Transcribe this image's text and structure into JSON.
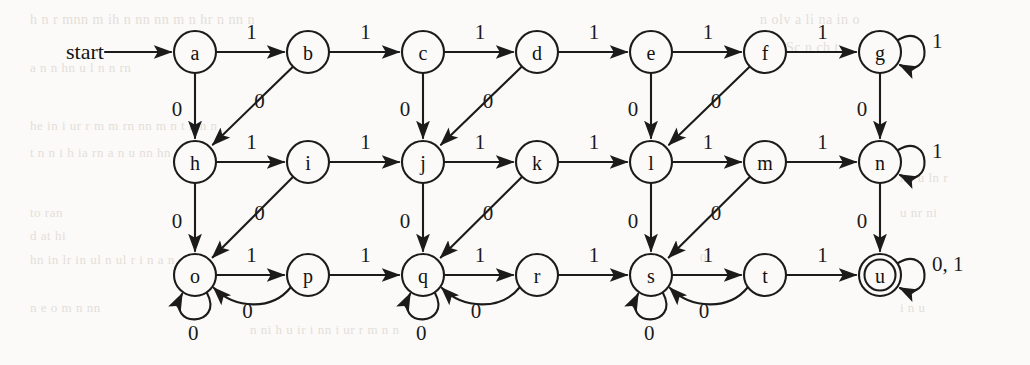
{
  "figure": {
    "kind": "finite-state-machine-diagram",
    "alphabet": [
      "0",
      "1"
    ],
    "start_label": "start",
    "start_state": "a",
    "accepting_states": [
      "u"
    ],
    "ink_color": "#1b1b1b",
    "page_color": "#fbfaf8"
  },
  "layout": {
    "width": 1030,
    "height": 365,
    "node_radius": 21,
    "columns_x": [
      195,
      308,
      423,
      537,
      651,
      765,
      880
    ],
    "rows_y": [
      52,
      162,
      275
    ]
  },
  "nodes": [
    {
      "id": "a",
      "label": "a",
      "col": 0,
      "row": 0,
      "accepting": false
    },
    {
      "id": "b",
      "label": "b",
      "col": 1,
      "row": 0,
      "accepting": false
    },
    {
      "id": "c",
      "label": "c",
      "col": 2,
      "row": 0,
      "accepting": false
    },
    {
      "id": "d",
      "label": "d",
      "col": 3,
      "row": 0,
      "accepting": false
    },
    {
      "id": "e",
      "label": "e",
      "col": 4,
      "row": 0,
      "accepting": false
    },
    {
      "id": "f",
      "label": "f",
      "col": 5,
      "row": 0,
      "accepting": false
    },
    {
      "id": "g",
      "label": "g",
      "col": 6,
      "row": 0,
      "accepting": false
    },
    {
      "id": "h",
      "label": "h",
      "col": 0,
      "row": 1,
      "accepting": false
    },
    {
      "id": "i",
      "label": "i",
      "col": 1,
      "row": 1,
      "accepting": false
    },
    {
      "id": "j",
      "label": "j",
      "col": 2,
      "row": 1,
      "accepting": false
    },
    {
      "id": "k",
      "label": "k",
      "col": 3,
      "row": 1,
      "accepting": false
    },
    {
      "id": "l",
      "label": "l",
      "col": 4,
      "row": 1,
      "accepting": false
    },
    {
      "id": "m",
      "label": "m",
      "col": 5,
      "row": 1,
      "accepting": false
    },
    {
      "id": "n",
      "label": "n",
      "col": 6,
      "row": 1,
      "accepting": false
    },
    {
      "id": "o",
      "label": "o",
      "col": 0,
      "row": 2,
      "accepting": false
    },
    {
      "id": "p",
      "label": "p",
      "col": 1,
      "row": 2,
      "accepting": false
    },
    {
      "id": "q",
      "label": "q",
      "col": 2,
      "row": 2,
      "accepting": false
    },
    {
      "id": "r",
      "label": "r",
      "col": 3,
      "row": 2,
      "accepting": false
    },
    {
      "id": "s",
      "label": "s",
      "col": 4,
      "row": 2,
      "accepting": false
    },
    {
      "id": "t",
      "label": "t",
      "col": 5,
      "row": 2,
      "accepting": false
    },
    {
      "id": "u",
      "label": "u",
      "col": 6,
      "row": 2,
      "accepting": true
    }
  ],
  "edges": [
    {
      "from": "a",
      "to": "b",
      "label": "1",
      "kind": "horizontal"
    },
    {
      "from": "b",
      "to": "c",
      "label": "1",
      "kind": "horizontal"
    },
    {
      "from": "c",
      "to": "d",
      "label": "1",
      "kind": "horizontal"
    },
    {
      "from": "d",
      "to": "e",
      "label": "1",
      "kind": "horizontal"
    },
    {
      "from": "e",
      "to": "f",
      "label": "1",
      "kind": "horizontal"
    },
    {
      "from": "f",
      "to": "g",
      "label": "1",
      "kind": "horizontal"
    },
    {
      "from": "h",
      "to": "i",
      "label": "1",
      "kind": "horizontal"
    },
    {
      "from": "i",
      "to": "j",
      "label": "1",
      "kind": "horizontal"
    },
    {
      "from": "j",
      "to": "k",
      "label": "1",
      "kind": "horizontal"
    },
    {
      "from": "k",
      "to": "l",
      "label": "1",
      "kind": "horizontal"
    },
    {
      "from": "l",
      "to": "m",
      "label": "1",
      "kind": "horizontal"
    },
    {
      "from": "m",
      "to": "n",
      "label": "1",
      "kind": "horizontal"
    },
    {
      "from": "o",
      "to": "p",
      "label": "1",
      "kind": "horizontal"
    },
    {
      "from": "p",
      "to": "q",
      "label": "1",
      "kind": "horizontal"
    },
    {
      "from": "q",
      "to": "r",
      "label": "1",
      "kind": "horizontal"
    },
    {
      "from": "r",
      "to": "s",
      "label": "1",
      "kind": "horizontal"
    },
    {
      "from": "s",
      "to": "t",
      "label": "1",
      "kind": "horizontal"
    },
    {
      "from": "t",
      "to": "u",
      "label": "1",
      "kind": "horizontal"
    },
    {
      "from": "a",
      "to": "h",
      "label": "0",
      "kind": "vertical"
    },
    {
      "from": "c",
      "to": "j",
      "label": "0",
      "kind": "vertical"
    },
    {
      "from": "e",
      "to": "l",
      "label": "0",
      "kind": "vertical"
    },
    {
      "from": "g",
      "to": "n",
      "label": "0",
      "kind": "vertical"
    },
    {
      "from": "h",
      "to": "o",
      "label": "0",
      "kind": "vertical"
    },
    {
      "from": "j",
      "to": "q",
      "label": "0",
      "kind": "vertical"
    },
    {
      "from": "l",
      "to": "s",
      "label": "0",
      "kind": "vertical"
    },
    {
      "from": "n",
      "to": "u",
      "label": "0",
      "kind": "vertical"
    },
    {
      "from": "b",
      "to": "h",
      "label": "0",
      "kind": "diagonal"
    },
    {
      "from": "d",
      "to": "j",
      "label": "0",
      "kind": "diagonal"
    },
    {
      "from": "f",
      "to": "l",
      "label": "0",
      "kind": "diagonal"
    },
    {
      "from": "i",
      "to": "o",
      "label": "0",
      "kind": "diagonal"
    },
    {
      "from": "k",
      "to": "q",
      "label": "0",
      "kind": "diagonal"
    },
    {
      "from": "m",
      "to": "s",
      "label": "0",
      "kind": "diagonal"
    },
    {
      "from": "p",
      "to": "o",
      "label": "0",
      "kind": "backcurve"
    },
    {
      "from": "r",
      "to": "q",
      "label": "0",
      "kind": "backcurve"
    },
    {
      "from": "t",
      "to": "s",
      "label": "0",
      "kind": "backcurve"
    },
    {
      "from": "g",
      "to": "g",
      "label": "1",
      "kind": "selfloop-right"
    },
    {
      "from": "n",
      "to": "n",
      "label": "1",
      "kind": "selfloop-right"
    },
    {
      "from": "u",
      "to": "u",
      "label": "0, 1",
      "kind": "selfloop-right"
    },
    {
      "from": "o",
      "to": "o",
      "label": "0",
      "kind": "selfloop-bottom"
    },
    {
      "from": "q",
      "to": "q",
      "label": "0",
      "kind": "selfloop-bottom"
    },
    {
      "from": "s",
      "to": "s",
      "label": "0",
      "kind": "selfloop-bottom"
    }
  ],
  "edge_labels": {
    "top_row": [
      "1",
      "1",
      "1",
      "1",
      "1",
      "1"
    ],
    "mid_row": [
      "1",
      "1",
      "1",
      "1",
      "1",
      "1"
    ],
    "bot_row": [
      "1",
      "1",
      "1",
      "1",
      "1",
      "1"
    ],
    "zero": "0",
    "one": "1",
    "self_u": "0, 1"
  },
  "bleed_text": [
    {
      "t": "h n r mnn m ih n  nn nn m  n  hr n nn  n",
      "x": 30,
      "y": 12,
      "size": 14
    },
    {
      "t": "n olv  a  li    na  in  o",
      "x": 760,
      "y": 12,
      "size": 14
    },
    {
      "t": "in  Sc  n  ch  t",
      "x": 770,
      "y": 40,
      "size": 14
    },
    {
      "t": "a  n   n  hn  u l  n   n   rn",
      "x": 30,
      "y": 60,
      "size": 13
    },
    {
      "t": "he  in  i  ur  r  m m  rn    nn m    n t   n  h  n",
      "x": 30,
      "y": 118,
      "size": 13
    },
    {
      "t": "t   n  n    i  h     ia    rn    a  n   u   nn    hn",
      "x": 30,
      "y": 145,
      "size": 13
    },
    {
      "t": "to  ran",
      "x": 30,
      "y": 205,
      "size": 13
    },
    {
      "t": "d  at  hi",
      "x": 30,
      "y": 228,
      "size": 13
    },
    {
      "t": "hn   in   lr  in    ul  n  ul   r i  n   a   n",
      "x": 30,
      "y": 252,
      "size": 13
    },
    {
      "t": "n  e  o   m  n  nn",
      "x": 30,
      "y": 300,
      "size": 13
    },
    {
      "t": "n ni    h u  ir   i   nn  i  ur  r   m  n   n",
      "x": 250,
      "y": 322,
      "size": 13
    },
    {
      "t": "0",
      "x": 700,
      "y": 250,
      "size": 13
    },
    {
      "t": "nn  u ln  r",
      "x": 900,
      "y": 170,
      "size": 13
    },
    {
      "t": "u nr  ni",
      "x": 900,
      "y": 205,
      "size": 13
    },
    {
      "t": "i  n u",
      "x": 900,
      "y": 300,
      "size": 13
    }
  ]
}
